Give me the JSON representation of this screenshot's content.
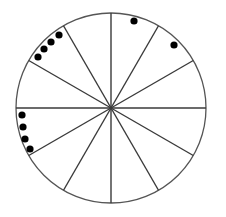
{
  "diagram": {
    "type": "divided-circle",
    "circle": {
      "cx": 111,
      "cy": 108,
      "r": 95,
      "stroke": "#555555",
      "fill": "#ffffff"
    },
    "sector_count": 12,
    "spoke_angles_deg": [
      0,
      30,
      60,
      90,
      120,
      150
    ],
    "spoke_color": "#3a3a3a",
    "dot_color": "#000000",
    "dot_radius": 3.6,
    "sectors_with_dots": [
      {
        "sector": "upper-left (120°–150°)",
        "count": 4
      },
      {
        "sector": "top-right (60°–90°)",
        "count": 1
      },
      {
        "sector": "upper-right (30°–60°)",
        "count": 1
      },
      {
        "sector": "left-below-horizontal (180°–210°)",
        "count": 4
      }
    ],
    "dots": [
      {
        "x": 59,
        "y": 35
      },
      {
        "x": 51,
        "y": 42
      },
      {
        "x": 44,
        "y": 49
      },
      {
        "x": 38,
        "y": 57
      },
      {
        "x": 134,
        "y": 21
      },
      {
        "x": 174,
        "y": 45
      },
      {
        "x": 22,
        "y": 115
      },
      {
        "x": 23,
        "y": 127
      },
      {
        "x": 25,
        "y": 139
      },
      {
        "x": 30,
        "y": 149
      }
    ]
  }
}
